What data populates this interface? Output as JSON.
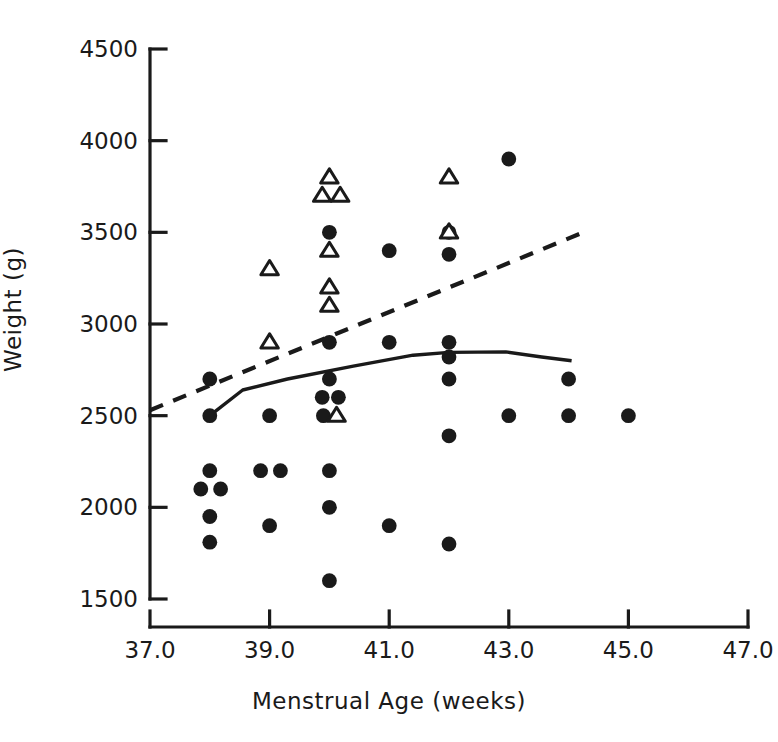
{
  "chart_data": {
    "type": "scatter",
    "title": "",
    "xlabel": "Menstrual Age (weeks)",
    "ylabel": "Weight (g)",
    "xlim": [
      37.0,
      47.0
    ],
    "ylim": [
      1500,
      4500
    ],
    "xticks": [
      "37.0",
      "39.0",
      "41.0",
      "43.0",
      "45.0",
      "47.0"
    ],
    "xtick_values": [
      37.0,
      39.0,
      41.0,
      43.0,
      45.0,
      47.0
    ],
    "yticks": [
      "1500",
      "2000",
      "2500",
      "3000",
      "3500",
      "4000",
      "4500"
    ],
    "ytick_values": [
      1500,
      2000,
      2500,
      3000,
      3500,
      4000,
      4500
    ],
    "grid": false,
    "legend": "none",
    "series": [
      {
        "name": "filled-circles",
        "marker": "filled-circle",
        "color": "#1a1a1a",
        "points": [
          [
            38.0,
            2700
          ],
          [
            38.0,
            2500
          ],
          [
            38.0,
            2200
          ],
          [
            37.85,
            2100
          ],
          [
            38.18,
            2100
          ],
          [
            38.0,
            1950
          ],
          [
            38.0,
            1810
          ],
          [
            39.0,
            2500
          ],
          [
            38.85,
            2200
          ],
          [
            39.18,
            2200
          ],
          [
            39.0,
            1900
          ],
          [
            40.0,
            3500
          ],
          [
            40.0,
            2900
          ],
          [
            40.0,
            2700
          ],
          [
            39.88,
            2600
          ],
          [
            40.15,
            2600
          ],
          [
            39.9,
            2500
          ],
          [
            40.0,
            2200
          ],
          [
            40.0,
            2000
          ],
          [
            40.0,
            1600
          ],
          [
            41.0,
            3400
          ],
          [
            41.0,
            2900
          ],
          [
            41.0,
            1900
          ],
          [
            42.0,
            3500
          ],
          [
            42.0,
            3380
          ],
          [
            42.0,
            2900
          ],
          [
            42.0,
            2820
          ],
          [
            42.0,
            2700
          ],
          [
            42.0,
            2390
          ],
          [
            42.0,
            1800
          ],
          [
            43.0,
            3900
          ],
          [
            43.0,
            2500
          ],
          [
            44.0,
            2700
          ],
          [
            44.0,
            2500
          ],
          [
            45.0,
            2500
          ]
        ]
      },
      {
        "name": "open-triangles",
        "marker": "open-triangle",
        "color": "#1a1a1a",
        "points": [
          [
            39.0,
            3300
          ],
          [
            39.0,
            2900
          ],
          [
            40.0,
            3800
          ],
          [
            39.88,
            3700
          ],
          [
            40.18,
            3700
          ],
          [
            40.0,
            3400
          ],
          [
            40.0,
            3200
          ],
          [
            40.0,
            3100
          ],
          [
            40.12,
            2500
          ],
          [
            42.0,
            3800
          ],
          [
            42.0,
            3500
          ]
        ]
      }
    ],
    "lines": [
      {
        "name": "dashed-trend-line",
        "style": "dashed",
        "color": "#1a1a1a",
        "points": [
          [
            37.0,
            2530
          ],
          [
            44.25,
            3500
          ]
        ]
      },
      {
        "name": "solid-curve",
        "style": "solid",
        "color": "#1a1a1a",
        "points": [
          [
            38.0,
            2500
          ],
          [
            38.55,
            2640
          ],
          [
            39.3,
            2700
          ],
          [
            40.4,
            2770
          ],
          [
            41.4,
            2830
          ],
          [
            42.0,
            2845
          ],
          [
            42.95,
            2848
          ],
          [
            43.55,
            2820
          ],
          [
            44.05,
            2800
          ]
        ]
      }
    ]
  },
  "axes": {
    "y_title": "Weight (g)",
    "x_title": "Menstrual Age (weeks)"
  }
}
